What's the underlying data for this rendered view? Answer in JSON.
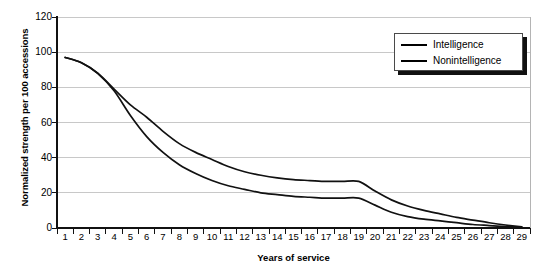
{
  "chart_data": {
    "type": "line",
    "title": "",
    "xlabel": "Years of service",
    "ylabel": "Normalized strength per 100 accessions",
    "xlim": [
      1,
      29
    ],
    "ylim": [
      0,
      120
    ],
    "yticks": [
      0,
      20,
      40,
      60,
      80,
      100,
      120
    ],
    "xticks": [
      1,
      2,
      3,
      4,
      5,
      6,
      7,
      8,
      9,
      10,
      11,
      12,
      13,
      14,
      15,
      16,
      17,
      18,
      19,
      20,
      21,
      22,
      23,
      24,
      25,
      26,
      27,
      28,
      29
    ],
    "grid": true,
    "legend_position": "top-right",
    "x": [
      1,
      2,
      3,
      4,
      5,
      6,
      7,
      8,
      9,
      10,
      11,
      12,
      13,
      14,
      15,
      16,
      17,
      18,
      19,
      20,
      21,
      22,
      23,
      24,
      25,
      26,
      27,
      28,
      29
    ],
    "series": [
      {
        "name": "Intelligence",
        "values": [
          97,
          94,
          88,
          78,
          64,
          52,
          43,
          36,
          31,
          27,
          24,
          22,
          20,
          19,
          18,
          17.5,
          17,
          17,
          17,
          13,
          9,
          6.5,
          5,
          4,
          3,
          2,
          1.4,
          0.8,
          0.3
        ]
      },
      {
        "name": "Nonintelligence",
        "values": [
          97,
          94,
          88,
          79,
          70,
          63,
          55,
          48,
          43,
          39,
          35,
          32,
          30,
          28.5,
          27.5,
          27,
          26.5,
          26.5,
          26.5,
          21,
          16,
          12.5,
          10,
          8,
          6,
          4.5,
          3,
          1.7,
          0.6
        ]
      }
    ]
  },
  "legend": {
    "items": [
      {
        "label": "Intelligence",
        "color": "#000000"
      },
      {
        "label": "Nonintelligence",
        "color": "#000000"
      }
    ]
  },
  "axis": {
    "y_tick_labels": [
      "120",
      "100",
      "80",
      "60",
      "40",
      "20",
      "0"
    ],
    "x_tick_labels": [
      "1",
      "2",
      "3",
      "4",
      "5",
      "6",
      "7",
      "8",
      "9",
      "10",
      "11",
      "12",
      "13",
      "14",
      "15",
      "16",
      "17",
      "18",
      "19",
      "20",
      "21",
      "22",
      "23",
      "24",
      "25",
      "26",
      "27",
      "28",
      "29"
    ],
    "y_axis_title": "Normalized strength per 100 accessions",
    "x_axis_title": "Years of service"
  },
  "colors": {
    "line": "#111111",
    "grid": "#c8c8c8",
    "axis": "#111111",
    "plot_border": "#b4b4b4",
    "background": "#ffffff"
  }
}
